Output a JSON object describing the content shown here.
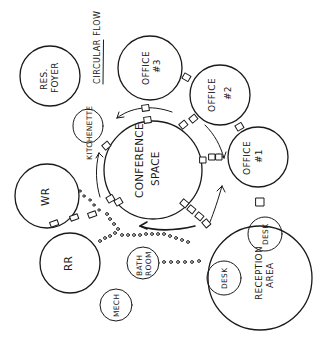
{
  "diagram": {
    "type": "bubble-adjacency-diagram",
    "style": "hand-drawn",
    "annotation": "CIRCULAR FLOW",
    "rooms": [
      {
        "id": "res_foyer",
        "lines": [
          "RES.",
          "FOYER"
        ]
      },
      {
        "id": "office_3",
        "lines": [
          "OFFICE",
          "#3"
        ]
      },
      {
        "id": "office_2",
        "lines": [
          "OFFICE",
          "#2"
        ]
      },
      {
        "id": "office_1",
        "lines": [
          "OFFICE",
          "#1"
        ]
      },
      {
        "id": "kitchenette",
        "lines": [
          "KITCHENETTE"
        ]
      },
      {
        "id": "conference",
        "lines": [
          "CONFERENCE",
          "SPACE"
        ]
      },
      {
        "id": "wr",
        "lines": [
          "WR"
        ]
      },
      {
        "id": "rr",
        "lines": [
          "RR"
        ]
      },
      {
        "id": "bathroom",
        "lines": [
          "BATH",
          "ROOM"
        ]
      },
      {
        "id": "mech",
        "lines": [
          "MECH"
        ]
      },
      {
        "id": "reception",
        "lines": [
          "RECEPTION",
          "AREA"
        ]
      },
      {
        "id": "desk_a",
        "lines": [
          "DESK"
        ]
      },
      {
        "id": "desk_b",
        "lines": [
          "DESK"
        ]
      }
    ],
    "connections": [
      {
        "from": "conference",
        "to": "office_3",
        "kind": "door-squares"
      },
      {
        "from": "conference",
        "to": "office_2",
        "kind": "door-squares"
      },
      {
        "from": "conference",
        "to": "office_1",
        "kind": "door-squares"
      },
      {
        "from": "conference",
        "to": "kitchenette",
        "kind": "door-squares"
      },
      {
        "from": "conference",
        "to": "reception",
        "kind": "door-squares"
      },
      {
        "from": "wr",
        "to": "conference",
        "kind": "door-squares"
      },
      {
        "from": "wr",
        "to": "rr",
        "kind": "door-squares"
      },
      {
        "from": "rr",
        "to": "reception",
        "kind": "dotted-path"
      },
      {
        "from": "wr",
        "to": "conference",
        "kind": "dotted-path"
      },
      {
        "from": "office_3",
        "to": "office_2",
        "kind": "door-squares"
      },
      {
        "from": "office_2",
        "to": "office_1",
        "kind": "door-squares"
      },
      {
        "from": "office_1",
        "to": "reception",
        "kind": "door-squares"
      }
    ],
    "flow": "circular arrows around conference space"
  }
}
